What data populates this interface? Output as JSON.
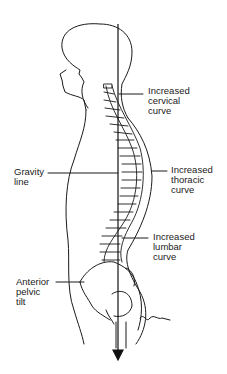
{
  "figure": {
    "labels": [
      {
        "id": "cervical",
        "text": "Increased\ncervical\ncurve"
      },
      {
        "id": "gravity",
        "text": "Gravity\nline"
      },
      {
        "id": "thoracic",
        "text": "Increased\nthoracic\ncurve"
      },
      {
        "id": "lumbar",
        "text": "Increased\nlumbar\ncurve"
      },
      {
        "id": "pelvic",
        "text": "Anterior\npelvic\ntilt"
      }
    ],
    "signature": "signature",
    "colors": {
      "line": "#1a1a1a",
      "background": "#ffffff"
    }
  }
}
